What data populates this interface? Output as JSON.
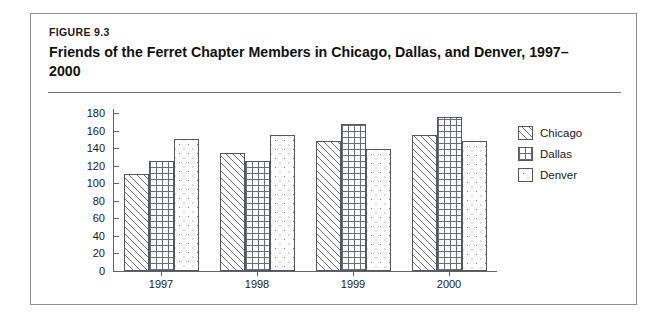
{
  "figure": {
    "label": "FIGURE 9.3",
    "title": "Friends of the Ferret Chapter Members in Chicago, Dallas, and Denver, 1997–2000"
  },
  "chart_data": {
    "type": "bar",
    "title": "Friends of the Ferret Chapter Members in Chicago, Dallas, and Denver, 1997–2000",
    "xlabel": "",
    "ylabel": "",
    "categories": [
      "1997",
      "1998",
      "1999",
      "2000"
    ],
    "series": [
      {
        "name": "Chicago",
        "pattern": "diagonal-hatch",
        "values": [
          110,
          135,
          148,
          155
        ]
      },
      {
        "name": "Dallas",
        "pattern": "crosshatch-grid",
        "values": [
          125,
          125,
          168,
          175
        ]
      },
      {
        "name": "Denver",
        "pattern": "dotted",
        "values": [
          150,
          155,
          139,
          148
        ]
      }
    ],
    "ylim": [
      0,
      180
    ],
    "yticks": [
      0,
      20,
      40,
      60,
      80,
      100,
      120,
      140,
      160,
      180
    ],
    "grid": false,
    "legend_position": "right"
  }
}
